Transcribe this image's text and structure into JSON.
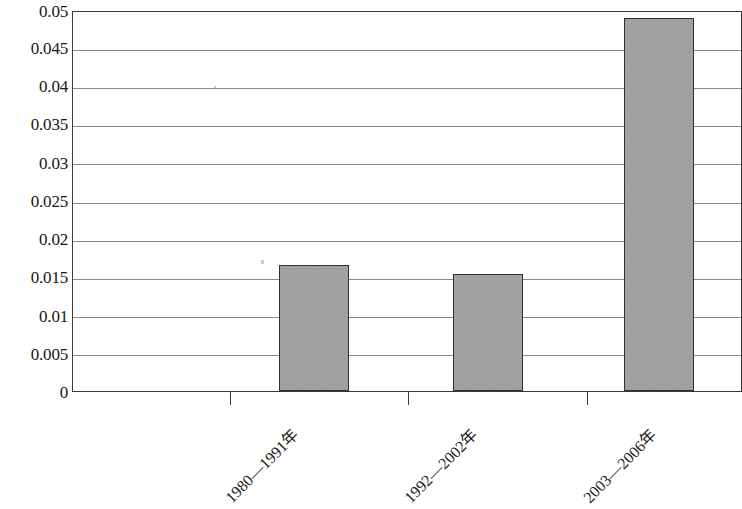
{
  "chart_data": {
    "type": "bar",
    "title": "",
    "subtitle": "",
    "xlabel": "",
    "ylabel": "",
    "categories": [
      "1980—1991年",
      "1992—2002年",
      "2003—2006年"
    ],
    "values": [
      0.0166,
      0.0154,
      0.0489
    ],
    "ylim": [
      0,
      0.05
    ],
    "ytick_labels": [
      "0.05",
      "0.045",
      "0.04",
      "0.035",
      "0.03",
      "0.025",
      "0.02",
      "0.015",
      "0.01",
      "0.005",
      "0"
    ],
    "ytick_values": [
      0.05,
      0.045,
      0.04,
      0.035,
      0.03,
      0.025,
      0.02,
      0.015,
      0.01,
      0.005,
      0
    ],
    "grid": true,
    "grid_axis": "y",
    "legend": false,
    "legend_position": "none",
    "bar_fill_color": "#9b9b9b",
    "bar_border_color": "#2f2f2f",
    "grid_color": "#8a8a8a",
    "frame_color": "#3a3a3a",
    "background_color": "#ffffff",
    "xtick_label_rotation": -45,
    "series": [
      {
        "name": "",
        "values": [
          0.0166,
          0.0154,
          0.0489
        ]
      }
    ]
  }
}
